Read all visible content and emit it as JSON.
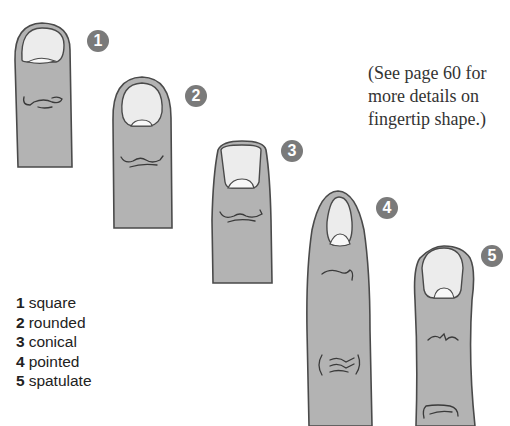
{
  "note": {
    "lines": [
      "(See page 60 for",
      "more details on",
      "fingertip shape.)"
    ]
  },
  "fingers": [
    {
      "number": "1",
      "shape": "square"
    },
    {
      "number": "2",
      "shape": "rounded"
    },
    {
      "number": "3",
      "shape": "conical"
    },
    {
      "number": "4",
      "shape": "pointed"
    },
    {
      "number": "5",
      "shape": "spatulate"
    }
  ],
  "legend": [
    {
      "number": "1",
      "label": "square"
    },
    {
      "number": "2",
      "label": "rounded"
    },
    {
      "number": "3",
      "label": "conical"
    },
    {
      "number": "4",
      "label": "pointed"
    },
    {
      "number": "5",
      "label": "spatulate"
    }
  ],
  "colors": {
    "skin": "#b3b3b3",
    "nail": "#ececec",
    "outline": "#4a4a4a",
    "badge": "#7a7a7a"
  }
}
